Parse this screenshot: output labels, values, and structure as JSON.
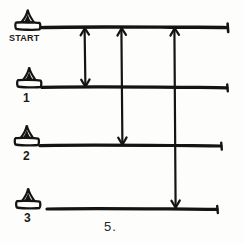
{
  "diagram": {
    "title": "START",
    "caption": "5.",
    "ink_color": "#141412",
    "background_color": "#fdfdfb",
    "style": "hand-drawn",
    "lanes": [
      {
        "id": "start",
        "label": "START",
        "icon": "cone-icon",
        "y": 28,
        "line_start_x": 42,
        "line_end_x": 228
      },
      {
        "id": "lane-1",
        "label": "1",
        "icon": "cone-icon",
        "y": 88,
        "line_start_x": 42,
        "line_end_x": 228
      },
      {
        "id": "lane-2",
        "label": "2",
        "icon": "cone-icon",
        "y": 146,
        "line_start_x": 42,
        "line_end_x": 222
      },
      {
        "id": "lane-3",
        "label": "3",
        "icon": "cone-icon",
        "y": 209,
        "line_start_x": 48,
        "line_end_x": 218
      }
    ],
    "connectors": [
      {
        "id": "connector-a",
        "from_lane": "start",
        "to_lane": "lane-1",
        "x": 85,
        "arrowheads": "both"
      },
      {
        "id": "connector-b",
        "from_lane": "start",
        "to_lane": "lane-2",
        "x": 122,
        "arrowheads": "both"
      },
      {
        "id": "connector-c",
        "from_lane": "start",
        "to_lane": "lane-3",
        "x": 175,
        "arrowheads": "both"
      }
    ]
  }
}
